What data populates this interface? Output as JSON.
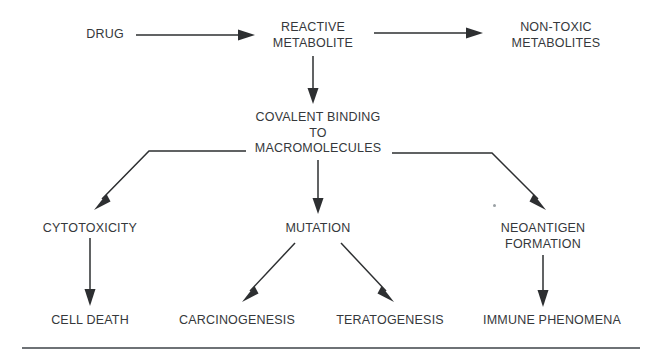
{
  "diagram": {
    "background_color": "#ffffff",
    "text_color": "#35383b",
    "line_color": "#2d2f31",
    "rule_color": "#6e7276",
    "nodes": [
      {
        "id": "drug",
        "lines": [
          "DRUG"
        ],
        "x": 105,
        "y": 27
      },
      {
        "id": "reactive-metabolite",
        "lines": [
          "REACTIVE",
          "METABOLITE"
        ],
        "x": 313,
        "y": 20
      },
      {
        "id": "non-toxic-metabolites",
        "lines": [
          "NON-TOXIC",
          "METABOLITES"
        ],
        "x": 556,
        "y": 20
      },
      {
        "id": "covalent-binding",
        "lines": [
          "COVALENT BINDING",
          "TO",
          "MACROMOLECULES"
        ],
        "x": 318,
        "y": 110
      },
      {
        "id": "cytotoxicity",
        "lines": [
          "CYTOTOXICITY"
        ],
        "x": 90,
        "y": 221
      },
      {
        "id": "mutation",
        "lines": [
          "MUTATION"
        ],
        "x": 318,
        "y": 221
      },
      {
        "id": "neoantigen-formation",
        "lines": [
          "NEOANTIGEN",
          "FORMATION"
        ],
        "x": 543,
        "y": 221
      },
      {
        "id": "cell-death",
        "lines": [
          "CELL DEATH"
        ],
        "x": 90,
        "y": 313
      },
      {
        "id": "carcinogenesis",
        "lines": [
          "CARCINOGENESIS"
        ],
        "x": 237,
        "y": 313
      },
      {
        "id": "teratogenesis",
        "lines": [
          "TERATOGENESIS"
        ],
        "x": 390,
        "y": 313
      },
      {
        "id": "immune-phenomena",
        "lines": [
          "IMMUNE PHENOMENA"
        ],
        "x": 552,
        "y": 313
      }
    ],
    "edges": [
      {
        "id": "drug-to-reactive-metabolite",
        "from": "drug",
        "to": "reactive-metabolite"
      },
      {
        "id": "reactive-metabolite-to-non-toxic",
        "from": "reactive-metabolite",
        "to": "non-toxic-metabolites"
      },
      {
        "id": "reactive-metabolite-to-covalent-binding",
        "from": "reactive-metabolite",
        "to": "covalent-binding"
      },
      {
        "id": "covalent-binding-to-cytotoxicity",
        "from": "covalent-binding",
        "to": "cytotoxicity"
      },
      {
        "id": "covalent-binding-to-mutation",
        "from": "covalent-binding",
        "to": "mutation"
      },
      {
        "id": "covalent-binding-to-neoantigen",
        "from": "covalent-binding",
        "to": "neoantigen-formation"
      },
      {
        "id": "cytotoxicity-to-cell-death",
        "from": "cytotoxicity",
        "to": "cell-death"
      },
      {
        "id": "mutation-to-carcinogenesis",
        "from": "mutation",
        "to": "carcinogenesis"
      },
      {
        "id": "mutation-to-teratogenesis",
        "from": "mutation",
        "to": "teratogenesis"
      },
      {
        "id": "neoantigen-to-immune-phenomena",
        "from": "neoantigen-formation",
        "to": "immune-phenomena"
      }
    ],
    "footer_rule": {
      "id": "bottom-rule",
      "x": 22,
      "y": 347,
      "width": 618
    }
  }
}
